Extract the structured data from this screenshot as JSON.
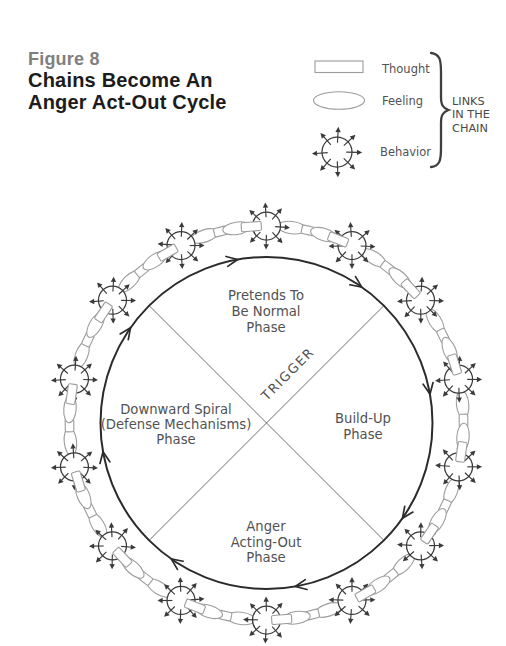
{
  "header": {
    "figure_label": "Figure 8",
    "title_lines": [
      "Chains Become An",
      "Anger Act-Out Cycle"
    ]
  },
  "legend": {
    "items": [
      {
        "shape": "rectangle",
        "label": "Thought"
      },
      {
        "shape": "ellipse",
        "label": "Feeling"
      },
      {
        "shape": "arrow-circle",
        "label": "Behavior"
      }
    ],
    "brace_label_lines": [
      "LINKS",
      "IN THE",
      "CHAIN"
    ]
  },
  "diagram": {
    "type": "cycle",
    "direction": "clockwise",
    "trigger_label": "TRIGGER",
    "phases": [
      {
        "id": "pretends-to-be-normal",
        "position": "top",
        "lines": [
          "Pretends To",
          "Be Normal",
          "Phase"
        ]
      },
      {
        "id": "build-up",
        "position": "right",
        "lines": [
          "Build-Up",
          "Phase"
        ]
      },
      {
        "id": "anger-acting-out",
        "position": "bottom",
        "lines": [
          "Anger",
          "Acting-Out",
          "Phase"
        ]
      },
      {
        "id": "downward-spiral",
        "position": "left",
        "lines": [
          "Downward Spiral",
          "(Defense Mechanisms)",
          "Phase"
        ]
      }
    ],
    "chain": {
      "behavior_link_count": 14,
      "segment_pattern": [
        "ellipse",
        "rectangle",
        "ellipse",
        "rectangle"
      ],
      "cycle_arrow_count": 8
    }
  },
  "colors": {
    "figure_label": "#7f7f7f",
    "title": "#1c1c1c",
    "diagram_text": "#525252",
    "main_circle": "#2b2b2b",
    "divider_lines": "#6f6f6f",
    "chain_light": "#9c9c9c",
    "chain_dark": "#3a3a3a"
  }
}
